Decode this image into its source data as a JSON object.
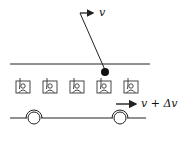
{
  "diagram": {
    "title": "",
    "labels": {
      "ball_velocity": "v",
      "bus_velocity": "v + Δv"
    },
    "elements": {
      "roof_line": {
        "x1": 10,
        "y1": 64,
        "x2": 150,
        "y2": 64
      },
      "floor_line": {
        "x1": 10,
        "y1": 118,
        "x2": 150,
        "y2": 118
      },
      "pendulum": {
        "top": [
          80,
          13
        ],
        "bob": [
          105,
          72
        ],
        "bob_radius": 4
      },
      "ball_arrow": {
        "from": [
          80,
          13
        ],
        "to": [
          94,
          13
        ]
      },
      "bus_arrow": {
        "from": [
          118,
          103
        ],
        "to": [
          138,
          103
        ]
      },
      "windows": [
        {
          "x": 16,
          "y": 81
        },
        {
          "x": 43,
          "y": 81
        },
        {
          "x": 70,
          "y": 81
        },
        {
          "x": 97,
          "y": 81
        },
        {
          "x": 124,
          "y": 81
        }
      ],
      "wheels": [
        {
          "cx": 34,
          "cy": 117,
          "r": 7
        },
        {
          "cx": 120,
          "cy": 117,
          "r": 7
        }
      ]
    },
    "colors": {
      "stroke": "#222222",
      "background": "#ffffff"
    }
  }
}
